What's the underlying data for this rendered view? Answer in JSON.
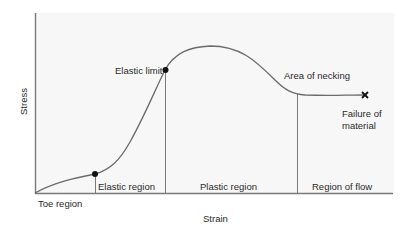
{
  "diagram": {
    "type": "stress-strain-curve",
    "axes": {
      "x_label": "Strain",
      "y_label": "Stress"
    },
    "points": {
      "elastic_limit": "Elastic limit",
      "area_of_necking": "Area of necking",
      "failure_line1": "Failure of",
      "failure_line2": "material"
    },
    "regions": {
      "toe": "Toe region",
      "elastic": "Elastic region",
      "plastic": "Plastic region",
      "flow": "Region of flow"
    },
    "colors": {
      "background_panel": "#f7f7f7",
      "curve": "#6b6b6b",
      "axis": "#7a7a7a",
      "marker": "#111111"
    }
  }
}
